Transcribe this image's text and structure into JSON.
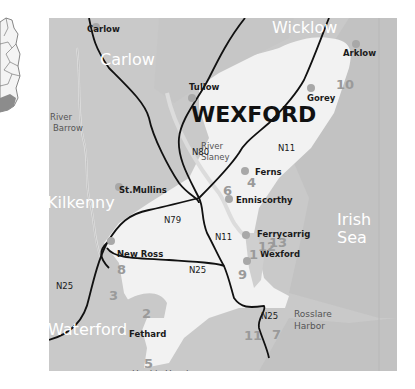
{
  "title": "WEXFORD",
  "colors": {
    "background": "#ffffff",
    "land_other": "#c8c8c8",
    "land_wexford": "#f2f2f2",
    "sea": "#c0c0c0",
    "road": "#111111",
    "town_dot": "#a8a8a8",
    "number": "#9a9a9a"
  },
  "inset_map": {
    "icon": "ireland-locator-map-icon",
    "highlight": "south-east-region"
  },
  "counties": [
    {
      "name": "Carlow"
    },
    {
      "name": "Wicklow"
    },
    {
      "name": "Kilkenny"
    },
    {
      "name": "Waterford"
    }
  ],
  "sea": {
    "line1": "Irish",
    "line2": "Sea"
  },
  "rivers": [
    {
      "line1": "River",
      "line2": "Barrow"
    },
    {
      "line1": "River",
      "line2": "Slaney"
    }
  ],
  "towns": [
    {
      "name": "Carlow"
    },
    {
      "name": "Tullow"
    },
    {
      "name": "Arklow"
    },
    {
      "name": "Gorey"
    },
    {
      "name": "Ferns"
    },
    {
      "name": "Enniscorthy"
    },
    {
      "name": "St.Mullins"
    },
    {
      "name": "New Ross"
    },
    {
      "name": "Ferrycarrig"
    },
    {
      "name": "Wexford"
    },
    {
      "name": "Fethard"
    }
  ],
  "places": [
    {
      "name": "Hook's Head"
    },
    {
      "line1": "Rosslare",
      "line2": "Harbor"
    }
  ],
  "roads": [
    {
      "label": "N80"
    },
    {
      "label": "N11"
    },
    {
      "label": "N79"
    },
    {
      "label": "N11"
    },
    {
      "label": "N25"
    },
    {
      "label": "N25"
    },
    {
      "label": "N25"
    }
  ],
  "site_numbers": [
    "10",
    "4",
    "6",
    "13",
    "12",
    "1",
    "9",
    "8",
    "3",
    "2",
    "11",
    "7",
    "5"
  ]
}
